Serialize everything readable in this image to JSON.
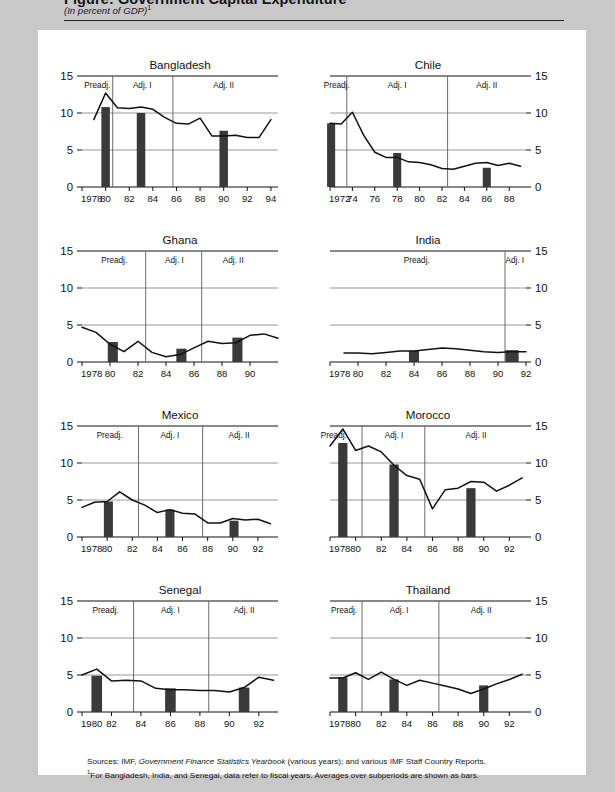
{
  "figure": {
    "title": "Figure: Government Capital Expenditure",
    "subtitle": "(In percent of GDP)",
    "subtitle_marker": "1"
  },
  "notes": {
    "sources_label": "Sources:",
    "sources_text": "IMF, Government Finance Statistics Yearbook (various years); and various IMF Staff Country Reports.",
    "sources_italic": "Government Finance Statistics Yearbook",
    "footnote_marker": "1",
    "footnote_text": "For Bangladesh, India, and Senegal, data refer to fiscal years. Averages over subperiods are shown as bars."
  },
  "style": {
    "line_color": "#111111",
    "bar_color": "#3a3a3a",
    "grid_color": "#8a8a8a",
    "divider_color": "#6a6a6a",
    "axis_color": "#111111",
    "panel_bg": "#ffffff",
    "page_bg": "#c8c8c8"
  },
  "common": {
    "yticks": [
      0,
      5,
      10,
      15
    ],
    "ylim": [
      0,
      15
    ],
    "phase_labels": [
      "Preadj.",
      "Adj. I",
      "Adj. II"
    ]
  },
  "chart_data": [
    {
      "type": "line",
      "title": "Bangladesh",
      "axis_side": "left",
      "xlabel": "",
      "ylabel": "",
      "ylim": [
        0,
        15
      ],
      "yticks": [
        0,
        5,
        10,
        15
      ],
      "grid": true,
      "xlim": [
        1978,
        1994.6
      ],
      "first_tick_label": "1978",
      "xticks": [
        1978,
        1980,
        1982,
        1984,
        1986,
        1988,
        1990,
        1992,
        1994
      ],
      "xtick_labels": [
        "1978",
        "80",
        "82",
        "84",
        "86",
        "88",
        "90",
        "92",
        "94"
      ],
      "x": [
        1979,
        1980,
        1981,
        1982,
        1983,
        1984,
        1985,
        1986,
        1987,
        1988,
        1989,
        1990,
        1991,
        1992,
        1993,
        1994
      ],
      "values": [
        9.1,
        12.7,
        10.7,
        10.6,
        10.8,
        10.5,
        9.4,
        8.6,
        8.5,
        9.3,
        6.9,
        6.9,
        7.0,
        6.7,
        6.7,
        9.1
      ],
      "dividers": [
        1980.6,
        1985.7
      ],
      "phases": [
        {
          "label": "Preadj.",
          "center": 1979.3
        },
        {
          "label": "Adj. I",
          "center": 1983.1
        },
        {
          "label": "Adj. II",
          "center": 1990.0
        }
      ],
      "bars": [
        {
          "x": 1980,
          "value": 10.8,
          "width": 0.72
        },
        {
          "x": 1983,
          "value": 10.0,
          "width": 0.72
        },
        {
          "x": 1990,
          "value": 7.6,
          "width": 0.72
        }
      ]
    },
    {
      "type": "line",
      "title": "Chile",
      "axis_side": "right",
      "ylim": [
        0,
        15
      ],
      "yticks": [
        0,
        5,
        10,
        15
      ],
      "grid": true,
      "xlim": [
        1972,
        1989.5
      ],
      "first_tick_label": "1972",
      "xticks": [
        1972,
        1974,
        1976,
        1978,
        1980,
        1982,
        1984,
        1986,
        1988
      ],
      "xtick_labels": [
        "1972",
        "74",
        "76",
        "78",
        "80",
        "82",
        "84",
        "86",
        "88"
      ],
      "x": [
        1972,
        1973,
        1974,
        1975,
        1976,
        1977,
        1978,
        1979,
        1980,
        1981,
        1982,
        1983,
        1984,
        1985,
        1986,
        1987,
        1988,
        1989
      ],
      "values": [
        8.6,
        8.5,
        10.1,
        7.0,
        4.7,
        4.0,
        4.0,
        3.4,
        3.3,
        3.0,
        2.5,
        2.4,
        2.8,
        3.2,
        3.3,
        2.9,
        3.2,
        2.8
      ],
      "dividers": [
        1973.5,
        1982.5
      ],
      "phases": [
        {
          "label": "Preadj.",
          "center": 1972.6
        },
        {
          "label": "Adj. I",
          "center": 1978.0
        },
        {
          "label": "Adj. II",
          "center": 1986.0
        }
      ],
      "bars": [
        {
          "x": 1972.1,
          "value": 8.6,
          "width": 0.72
        },
        {
          "x": 1978,
          "value": 4.6,
          "width": 0.72
        },
        {
          "x": 1986,
          "value": 2.6,
          "width": 0.72
        }
      ]
    },
    {
      "type": "line",
      "title": "Ghana",
      "axis_side": "left",
      "ylim": [
        0,
        15
      ],
      "yticks": [
        0,
        5,
        10,
        15
      ],
      "grid": true,
      "xlim": [
        1978,
        1992
      ],
      "first_tick_label": "1978",
      "xticks": [
        1978,
        1980,
        1982,
        1984,
        1986,
        1988,
        1990
      ],
      "xtick_labels": [
        "1978",
        "80",
        "82",
        "84",
        "86",
        "88",
        "90"
      ],
      "x": [
        1978,
        1979,
        1980,
        1981,
        1982,
        1983,
        1984,
        1985,
        1986,
        1987,
        1988,
        1989,
        1990,
        1991,
        1992
      ],
      "values": [
        4.7,
        4.0,
        2.4,
        1.4,
        2.8,
        1.3,
        0.7,
        1.0,
        1.9,
        2.8,
        2.5,
        2.6,
        3.6,
        3.8,
        3.2
      ],
      "dividers": [
        1982.55,
        1986.55
      ],
      "phases": [
        {
          "label": "Preadj.",
          "center": 1980.3
        },
        {
          "label": "Adj. I",
          "center": 1984.6
        },
        {
          "label": "Adj. II",
          "center": 1988.8
        }
      ],
      "bars": [
        {
          "x": 1980.2,
          "value": 2.7,
          "width": 0.72
        },
        {
          "x": 1985.1,
          "value": 1.8,
          "width": 0.72
        },
        {
          "x": 1989.1,
          "value": 3.3,
          "width": 0.72
        }
      ]
    },
    {
      "type": "line",
      "title": "India",
      "axis_side": "right",
      "ylim": [
        0,
        15
      ],
      "yticks": [
        0,
        5,
        10,
        15
      ],
      "grid": true,
      "xlim": [
        1978,
        1992
      ],
      "first_tick_label": "1978",
      "xticks": [
        1978,
        1980,
        1982,
        1984,
        1986,
        1988,
        1990,
        1992
      ],
      "xtick_labels": [
        "1978",
        "80",
        "82",
        "84",
        "86",
        "88",
        "90",
        "92"
      ],
      "x": [
        1979,
        1980,
        1981,
        1982,
        1983,
        1984,
        1985,
        1986,
        1987,
        1988,
        1989,
        1990,
        1991,
        1992
      ],
      "values": [
        1.2,
        1.2,
        1.1,
        1.3,
        1.5,
        1.5,
        1.7,
        1.9,
        1.8,
        1.6,
        1.4,
        1.3,
        1.4,
        1.4
      ],
      "dividers": [
        1990.5
      ],
      "phases": [
        {
          "label": "Preadj.",
          "center": 1984.2
        },
        {
          "label": "Adj. I",
          "center": 1991.2
        }
      ],
      "bars": [
        {
          "x": 1984,
          "value": 1.5,
          "width": 0.72
        },
        {
          "x": 1991,
          "value": 1.6,
          "width": 0.95
        }
      ]
    },
    {
      "type": "line",
      "title": "Mexico",
      "axis_side": "left",
      "ylim": [
        0,
        15
      ],
      "yticks": [
        0,
        5,
        10,
        15
      ],
      "grid": true,
      "xlim": [
        1978,
        1993.6
      ],
      "first_tick_label": "1978",
      "xticks": [
        1978,
        1980,
        1982,
        1984,
        1986,
        1988,
        1990,
        1992
      ],
      "xtick_labels": [
        "1978",
        "80",
        "82",
        "84",
        "86",
        "88",
        "90",
        "92"
      ],
      "x": [
        1978,
        1979,
        1980,
        1981,
        1982,
        1983,
        1984,
        1985,
        1986,
        1987,
        1988,
        1989,
        1990,
        1991,
        1992,
        1993
      ],
      "values": [
        4.0,
        4.7,
        4.8,
        6.1,
        5.0,
        4.3,
        3.3,
        3.7,
        3.2,
        3.1,
        1.9,
        1.9,
        2.5,
        2.3,
        2.4,
        1.8
      ],
      "dividers": [
        1982.5,
        1987.6
      ],
      "phases": [
        {
          "label": "Preadj.",
          "center": 1980.2
        },
        {
          "label": "Adj. I",
          "center": 1985.0
        },
        {
          "label": "Adj. II",
          "center": 1990.5
        }
      ],
      "bars": [
        {
          "x": 1980.1,
          "value": 4.8,
          "width": 0.72
        },
        {
          "x": 1985,
          "value": 3.7,
          "width": 0.72
        },
        {
          "x": 1990.1,
          "value": 2.2,
          "width": 0.72
        }
      ]
    },
    {
      "type": "line",
      "title": "Morocco",
      "axis_side": "right",
      "ylim": [
        0,
        15
      ],
      "yticks": [
        0,
        5,
        10,
        15
      ],
      "grid": true,
      "xlim": [
        1978,
        1993.3
      ],
      "first_tick_label": "1978",
      "xticks": [
        1978,
        1980,
        1982,
        1984,
        1986,
        1988,
        1990,
        1992
      ],
      "xtick_labels": [
        "1978",
        "80",
        "82",
        "84",
        "86",
        "88",
        "90",
        "92"
      ],
      "x": [
        1978,
        1979,
        1980,
        1981,
        1982,
        1983,
        1984,
        1985,
        1986,
        1987,
        1988,
        1989,
        1990,
        1991,
        1992,
        1993
      ],
      "values": [
        12.3,
        14.6,
        11.7,
        12.3,
        11.5,
        9.7,
        8.3,
        7.8,
        3.8,
        6.4,
        6.6,
        7.5,
        7.4,
        6.2,
        7.0,
        8.0
      ],
      "dividers": [
        1980.5,
        1985.4
      ],
      "phases": [
        {
          "label": "Preadj.",
          "center": 1978.3
        },
        {
          "label": "Adj. I",
          "center": 1983.0
        },
        {
          "label": "Adj. II",
          "center": 1989.4
        }
      ],
      "bars": [
        {
          "x": 1979,
          "value": 12.7,
          "width": 0.72
        },
        {
          "x": 1983,
          "value": 9.8,
          "width": 0.72
        },
        {
          "x": 1989,
          "value": 6.6,
          "width": 0.72
        }
      ]
    },
    {
      "type": "line",
      "title": "Senegal",
      "axis_side": "left",
      "ylim": [
        0,
        15
      ],
      "yticks": [
        0,
        5,
        10,
        15
      ],
      "grid": true,
      "xlim": [
        1980,
        1993.3
      ],
      "first_tick_label": "1980",
      "xticks": [
        1980,
        1982,
        1984,
        1986,
        1988,
        1990,
        1992
      ],
      "xtick_labels": [
        "1980",
        "82",
        "84",
        "86",
        "88",
        "90",
        "92"
      ],
      "x": [
        1980,
        1981,
        1982,
        1983,
        1984,
        1985,
        1986,
        1987,
        1988,
        1989,
        1990,
        1991,
        1992,
        1993
      ],
      "values": [
        5.0,
        5.8,
        4.2,
        4.3,
        4.2,
        3.2,
        3.0,
        3.0,
        2.9,
        2.9,
        2.7,
        3.3,
        4.7,
        4.3
      ],
      "dividers": [
        1983.5,
        1988.6
      ],
      "phases": [
        {
          "label": "Preadj.",
          "center": 1981.6
        },
        {
          "label": "Adj. I",
          "center": 1986.0
        },
        {
          "label": "Adj. II",
          "center": 1991.0
        }
      ],
      "bars": [
        {
          "x": 1981,
          "value": 4.9,
          "width": 0.72
        },
        {
          "x": 1986,
          "value": 3.2,
          "width": 0.72
        },
        {
          "x": 1991,
          "value": 3.3,
          "width": 0.72
        }
      ]
    },
    {
      "type": "line",
      "title": "Thailand",
      "axis_side": "right",
      "ylim": [
        0,
        15
      ],
      "yticks": [
        0,
        5,
        10,
        15
      ],
      "grid": true,
      "xlim": [
        1978,
        1993.3
      ],
      "first_tick_label": "1978",
      "xticks": [
        1978,
        1980,
        1982,
        1984,
        1986,
        1988,
        1990,
        1992
      ],
      "xtick_labels": [
        "1978",
        "80",
        "82",
        "84",
        "86",
        "88",
        "90",
        "92"
      ],
      "x": [
        1978,
        1979,
        1980,
        1981,
        1982,
        1983,
        1984,
        1985,
        1986,
        1987,
        1988,
        1989,
        1990,
        1991,
        1992,
        1993
      ],
      "values": [
        4.6,
        4.6,
        5.3,
        4.4,
        5.4,
        4.4,
        3.6,
        4.3,
        3.9,
        3.5,
        3.1,
        2.5,
        3.1,
        3.8,
        4.4,
        5.1
      ],
      "dividers": [
        1980.5,
        1986.5
      ],
      "phases": [
        {
          "label": "Preadj.",
          "center": 1979.1
        },
        {
          "label": "Adj. I",
          "center": 1983.4
        },
        {
          "label": "Adj. II",
          "center": 1989.8
        }
      ],
      "bars": [
        {
          "x": 1979,
          "value": 4.7,
          "width": 0.72
        },
        {
          "x": 1983,
          "value": 4.4,
          "width": 0.72
        },
        {
          "x": 1990,
          "value": 3.6,
          "width": 0.72
        }
      ]
    }
  ]
}
